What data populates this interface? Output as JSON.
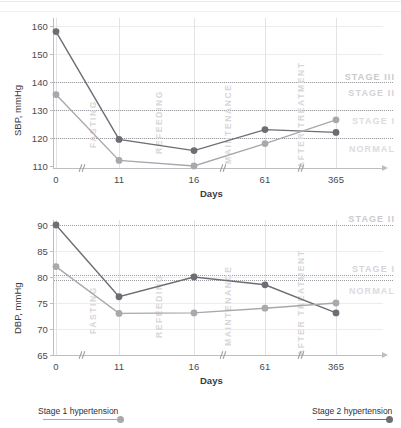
{
  "chart_data": [
    {
      "type": "line",
      "id": "sbp",
      "title": "",
      "xlabel": "Days",
      "ylabel": "SBP, mmHg",
      "x": [
        "0",
        "11",
        "16",
        "61",
        "365"
      ],
      "xticks": [
        "0",
        "11",
        "16",
        "61",
        "365"
      ],
      "yticks": [
        "110",
        "120",
        "130",
        "140",
        "150",
        "160"
      ],
      "ylim": [
        108,
        162
      ],
      "grid": true,
      "legend_position": "bottom",
      "series": [
        {
          "name": "Stage 2 hypertension",
          "color": "#6d6d73",
          "values": [
            158,
            119.5,
            115.5,
            123,
            122
          ]
        },
        {
          "name": "Stage 1 hypertension",
          "color": "#a8a8ad",
          "values": [
            135.5,
            112,
            110,
            118,
            126.5
          ]
        }
      ],
      "thresholds": [
        {
          "value": 140,
          "label": "STAGE III",
          "label_position": "above"
        },
        {
          "value": 140,
          "label": "STAGE II",
          "label_position": "below"
        },
        {
          "value": 130,
          "label": "STAGE I",
          "label_position": "below"
        },
        {
          "value": 120,
          "label": "NORMAL",
          "label_position": "below"
        }
      ],
      "phases": [
        "FASTING",
        "REFEEDING",
        "MAINTENANCE",
        "AFTER TREATMENT"
      ]
    },
    {
      "type": "line",
      "id": "dbp",
      "title": "",
      "xlabel": "Days",
      "ylabel": "DBP, mmHg",
      "x": [
        "0",
        "11",
        "16",
        "61",
        "365"
      ],
      "xticks": [
        "0",
        "11",
        "16",
        "61",
        "365"
      ],
      "yticks": [
        "65",
        "70",
        "75",
        "80",
        "85",
        "90"
      ],
      "ylim": [
        64,
        92
      ],
      "grid": true,
      "legend_position": "bottom",
      "series": [
        {
          "name": "Stage 2 hypertension",
          "color": "#6d6d73",
          "values": [
            90,
            76.2,
            80,
            78.5,
            73.1
          ]
        },
        {
          "name": "Stage 1 hypertension",
          "color": "#a8a8ad",
          "values": [
            82,
            73,
            73.1,
            74,
            75
          ]
        }
      ],
      "thresholds": [
        {
          "value": 90,
          "label": "STAGE II",
          "label_position": "above"
        },
        {
          "value": 80,
          "label": "STAGE I",
          "label_position": "above"
        },
        {
          "value": 79.4,
          "label": "NORMAL",
          "label_position": "below"
        }
      ],
      "phases": [
        "FASTING",
        "REFEEDING",
        "MAINTENANCE",
        "AFTER TREATMENT"
      ]
    }
  ],
  "sbp": {
    "ylabel": "SBP, mmHg",
    "xlabel": "Days",
    "yticks": [
      "160",
      "150",
      "140",
      "130",
      "120",
      "110"
    ],
    "xticks": [
      "0",
      "11",
      "16",
      "61",
      "365"
    ],
    "stage_labels": [
      "STAGE III",
      "STAGE II",
      "STAGE I",
      "NORMAL"
    ],
    "phases": [
      "FASTING",
      "REFEEDING",
      "MAINTENANCE",
      "AFTER TREATMENT"
    ]
  },
  "dbp": {
    "ylabel": "DBP, mmHg",
    "xlabel": "Days",
    "yticks": [
      "90",
      "85",
      "80",
      "75",
      "70",
      "65"
    ],
    "xticks": [
      "0",
      "11",
      "16",
      "61",
      "365"
    ],
    "stage_labels": [
      "STAGE II",
      "STAGE I",
      "NORMAL"
    ],
    "phases": [
      "FASTING",
      "REFEEDING",
      "MAINTENANCE",
      "AFTER TREATMENT"
    ]
  },
  "legend": {
    "stage1": "Stage 1 hypertension",
    "stage2": "Stage 2 hypertension"
  },
  "colors": {
    "stage1": "#a8a8ad",
    "stage2": "#6d6d73",
    "stage_label": "#d9d9dd",
    "axis": "#bdbdc2",
    "threshold": "#9b9ba0"
  }
}
